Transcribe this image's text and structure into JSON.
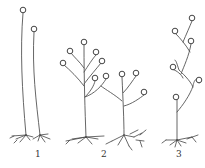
{
  "figure": {
    "colors": {
      "line": "#555555",
      "background": "#ffffff"
    },
    "panels": [
      {
        "id": "1",
        "label": "1",
        "type": "unbranched sporangiophores"
      },
      {
        "id": "2",
        "label": "2",
        "type": "sympodially/racemose branched sporangiophores"
      },
      {
        "id": "3",
        "label": "3",
        "type": "zigzag sympodially branched sporangiophore"
      }
    ]
  }
}
